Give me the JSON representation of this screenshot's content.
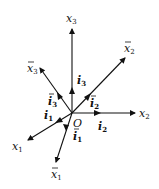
{
  "diagram": {
    "origin_label": "O",
    "axes": [
      {
        "id": "x1",
        "label": "x",
        "sub": "1",
        "bar": false
      },
      {
        "id": "x2",
        "label": "x",
        "sub": "2",
        "bar": false
      },
      {
        "id": "x3",
        "label": "x",
        "sub": "3",
        "bar": false
      },
      {
        "id": "xb1",
        "label": "x",
        "sub": "1",
        "bar": true
      },
      {
        "id": "xb2",
        "label": "x",
        "sub": "2",
        "bar": true
      },
      {
        "id": "xb3",
        "label": "x",
        "sub": "3",
        "bar": true
      }
    ],
    "unit_vectors": [
      {
        "id": "i1",
        "label": "i",
        "sub": "1",
        "bar": false
      },
      {
        "id": "i2",
        "label": "i",
        "sub": "2",
        "bar": false
      },
      {
        "id": "i3",
        "label": "i",
        "sub": "3",
        "bar": false
      },
      {
        "id": "ib1",
        "label": "i",
        "sub": "1",
        "bar": true
      },
      {
        "id": "ib2",
        "label": "i",
        "sub": "2",
        "bar": true
      },
      {
        "id": "ib3",
        "label": "i",
        "sub": "3",
        "bar": true
      }
    ]
  }
}
